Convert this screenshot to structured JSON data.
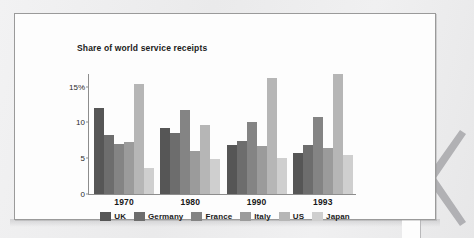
{
  "chart_data": {
    "type": "bar",
    "title": "Share of world service receipts",
    "xlabel": "",
    "ylabel": "",
    "ylim": [
      0,
      16.5
    ],
    "yticks": [
      0,
      5,
      10,
      15
    ],
    "ytick_labels": [
      "0",
      "5",
      "10",
      "15%"
    ],
    "grid": false,
    "legend_position": "bottom",
    "categories": [
      "1970",
      "1980",
      "1990",
      "1993"
    ],
    "series": [
      {
        "name": "UK",
        "color": "#565656",
        "values": [
          12.0,
          9.2,
          6.9,
          5.8
        ]
      },
      {
        "name": "Germany",
        "color": "#6d6d6d",
        "values": [
          8.2,
          8.5,
          7.4,
          6.8
        ]
      },
      {
        "name": "France",
        "color": "#848484",
        "values": [
          7.0,
          11.8,
          10.0,
          10.7
        ]
      },
      {
        "name": "Italy",
        "color": "#9b9b9b",
        "values": [
          7.3,
          6.0,
          6.7,
          6.5
        ]
      },
      {
        "name": "US",
        "color": "#b6b6b6",
        "values": [
          15.4,
          9.6,
          16.2,
          16.8
        ]
      },
      {
        "name": "Japan",
        "color": "#cfcfcf",
        "values": [
          3.6,
          4.9,
          5.1,
          5.5
        ]
      }
    ]
  },
  "figure": {
    "frame_border_color": "#9a9a9a",
    "background_color": "#fdfdfd",
    "axis_color": "#8d8d8d"
  }
}
